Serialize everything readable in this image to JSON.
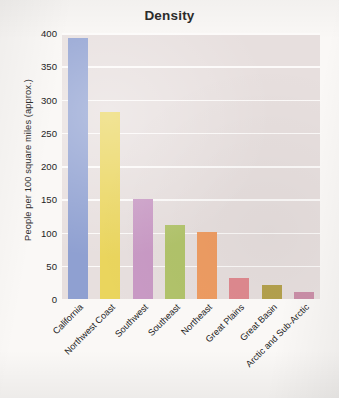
{
  "chart_data": {
    "type": "bar",
    "title": "Density",
    "xlabel": "",
    "ylabel": "People per 100 square miles (approx.)",
    "categories": [
      "California",
      "Northwest Coast",
      "Southwest",
      "Southeast",
      "Northeast",
      "Great Plains",
      "Great Basin",
      "Arctic and Sub-Arctic"
    ],
    "values": [
      392,
      281,
      151,
      112,
      101,
      31,
      21,
      11
    ],
    "bar_colors": [
      "#8fa0d1",
      "#ead55d",
      "#c99ac5",
      "#b2c46b",
      "#ef9d63",
      "#e08a90",
      "#b5a24e",
      "#cb8fa8"
    ],
    "ylim": [
      0,
      400
    ],
    "yticks": [
      0,
      50,
      100,
      150,
      200,
      250,
      300,
      350,
      400
    ],
    "ytick_labels": [
      "0",
      "50",
      "100",
      "150",
      "200",
      "250",
      "300",
      "350",
      "400"
    ],
    "grid": "horizontal",
    "legend": "none",
    "plot_background": "#e7dfde",
    "gridline_color": "#fdfbfa",
    "page_background": "#faf8f6",
    "title_color": "#2b2b2b",
    "tick_label_color": "#1f1f1f"
  }
}
